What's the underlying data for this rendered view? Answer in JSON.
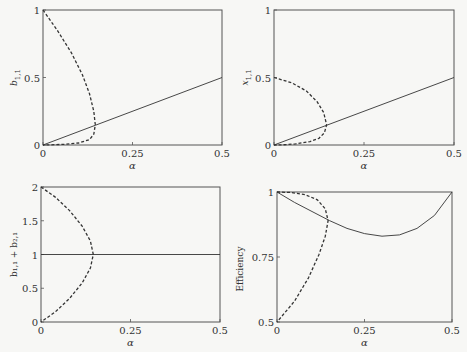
{
  "chart_data": [
    {
      "type": "line",
      "panel": "top-left",
      "xlabel": "α",
      "ylabel": "b_{1,1}",
      "xlim": [
        0,
        0.5
      ],
      "ylim": [
        0,
        1
      ],
      "xticks": [
        "0",
        "0.25",
        "0.5"
      ],
      "yticks": [
        "0",
        "0.5",
        "1"
      ],
      "series": [
        {
          "name": "solid",
          "style": "solid",
          "x": [
            0,
            0.5
          ],
          "y": [
            0,
            0.5
          ]
        },
        {
          "name": "dashed",
          "style": "dashed",
          "x": [
            0,
            0.04,
            0.08,
            0.11,
            0.13,
            0.142,
            0.146,
            0.142,
            0.13,
            0.1,
            0.06,
            0.02,
            0
          ],
          "y": [
            1,
            0.85,
            0.68,
            0.52,
            0.38,
            0.25,
            0.15,
            0.08,
            0.04,
            0.015,
            0.005,
            0.001,
            0
          ]
        }
      ]
    },
    {
      "type": "line",
      "panel": "top-right",
      "xlabel": "α",
      "ylabel": "x_{1,1}",
      "xlim": [
        0,
        0.5
      ],
      "ylim": [
        0,
        1
      ],
      "xticks": [
        "0",
        "0.25",
        "0.5"
      ],
      "yticks": [
        "0",
        "0.5",
        "1"
      ],
      "series": [
        {
          "name": "solid",
          "style": "solid",
          "x": [
            0,
            0.5
          ],
          "y": [
            0,
            0.5
          ]
        },
        {
          "name": "dashed",
          "style": "dashed",
          "x": [
            0,
            0.05,
            0.09,
            0.12,
            0.138,
            0.146,
            0.14,
            0.125,
            0.1,
            0.06,
            0.02,
            0
          ],
          "y": [
            0.5,
            0.46,
            0.4,
            0.32,
            0.24,
            0.15,
            0.09,
            0.05,
            0.025,
            0.008,
            0.001,
            0
          ]
        }
      ]
    },
    {
      "type": "line",
      "panel": "bottom-left",
      "xlabel": "α",
      "ylabel": "b_{1,1} + b_{2,1}",
      "xlim": [
        0,
        0.5
      ],
      "ylim": [
        0,
        2
      ],
      "xticks": [
        "0",
        "0.25",
        "0.5"
      ],
      "yticks": [
        "0",
        "0.5",
        "1",
        "1.5",
        "2"
      ],
      "series": [
        {
          "name": "solid",
          "style": "solid",
          "x": [
            0,
            0.5
          ],
          "y": [
            1,
            1
          ]
        },
        {
          "name": "dashed",
          "style": "dashed",
          "x": [
            0,
            0.04,
            0.08,
            0.115,
            0.138,
            0.146,
            0.138,
            0.115,
            0.08,
            0.04,
            0
          ],
          "y": [
            2,
            1.85,
            1.65,
            1.42,
            1.2,
            1.0,
            0.8,
            0.58,
            0.35,
            0.15,
            0
          ]
        }
      ]
    },
    {
      "type": "line",
      "panel": "bottom-right",
      "xlabel": "α",
      "ylabel": "Efficiency",
      "xlim": [
        0,
        0.5
      ],
      "ylim": [
        0.5,
        1
      ],
      "xticks": [
        "0",
        "0.25",
        "0.5"
      ],
      "yticks": [
        "0.5",
        "0.75",
        "1"
      ],
      "series": [
        {
          "name": "solid",
          "style": "solid",
          "x": [
            0,
            0.05,
            0.1,
            0.15,
            0.2,
            0.25,
            0.3,
            0.35,
            0.4,
            0.45,
            0.5
          ],
          "y": [
            1,
            0.96,
            0.925,
            0.89,
            0.86,
            0.84,
            0.83,
            0.835,
            0.86,
            0.91,
            1
          ]
        },
        {
          "name": "dashed",
          "style": "dashed",
          "x": [
            0,
            0.04,
            0.08,
            0.115,
            0.138,
            0.146,
            0.138,
            0.12,
            0.09,
            0.05,
            0
          ],
          "y": [
            1,
            0.998,
            0.99,
            0.97,
            0.935,
            0.89,
            0.83,
            0.76,
            0.67,
            0.58,
            0.5
          ]
        }
      ]
    }
  ],
  "panels": {
    "tl": {
      "ylabel": "b",
      "ysub": "1,1",
      "xlabel": "α",
      "xt0": "0",
      "xt1": "0.25",
      "xt2": "0.5",
      "yt": [
        "0",
        "0.5",
        "1"
      ]
    },
    "tr": {
      "ylabel": "x",
      "ysub": "1,1",
      "xlabel": "α",
      "xt0": "0",
      "xt1": "0.25",
      "xt2": "0.5",
      "yt": [
        "0",
        "0.5",
        "1"
      ]
    },
    "bl": {
      "ylabel": "b₁,₁ + b₂,₁",
      "xlabel": "α",
      "xt0": "0",
      "xt1": "0.25",
      "xt2": "0.5",
      "yt": [
        "0",
        "0.5",
        "1",
        "1.5",
        "2"
      ]
    },
    "br": {
      "ylabel": "Efficiency",
      "xlabel": "α",
      "xt0": "0",
      "xt1": "0.25",
      "xt2": "0.5",
      "yt": [
        "0.5",
        "0.75",
        "1"
      ]
    }
  },
  "colors": {
    "line": "#333333",
    "axis": "#555555",
    "background": "#f7f7f5"
  }
}
